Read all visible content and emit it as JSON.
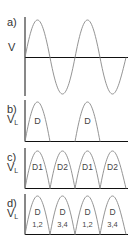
{
  "figure": {
    "colors": {
      "axis": "#111111",
      "wave": "#888888",
      "text": "#333333"
    },
    "panels": [
      {
        "id": "a",
        "label": "a)",
        "ylabel": "V",
        "ylabel_sub": "",
        "type": "sine",
        "segments": []
      },
      {
        "id": "b",
        "label": "b)",
        "ylabel": "V",
        "ylabel_sub": "L",
        "type": "half-wave",
        "segments": [
          {
            "text": "D",
            "text2": ""
          },
          {
            "text": "D",
            "text2": ""
          }
        ]
      },
      {
        "id": "c",
        "label": "c)",
        "ylabel": "V",
        "ylabel_sub": "L",
        "type": "full-wave-center-tap",
        "segments": [
          {
            "text": "D1",
            "text2": ""
          },
          {
            "text": "D2",
            "text2": ""
          },
          {
            "text": "D1",
            "text2": ""
          },
          {
            "text": "D2",
            "text2": ""
          }
        ]
      },
      {
        "id": "d",
        "label": "d)",
        "ylabel": "V",
        "ylabel_sub": "L",
        "type": "full-wave-bridge",
        "segments": [
          {
            "text": "D",
            "text2": "1,2"
          },
          {
            "text": "D",
            "text2": "3,4"
          },
          {
            "text": "D",
            "text2": "1,2"
          },
          {
            "text": "D",
            "text2": "3,4"
          }
        ]
      }
    ]
  }
}
